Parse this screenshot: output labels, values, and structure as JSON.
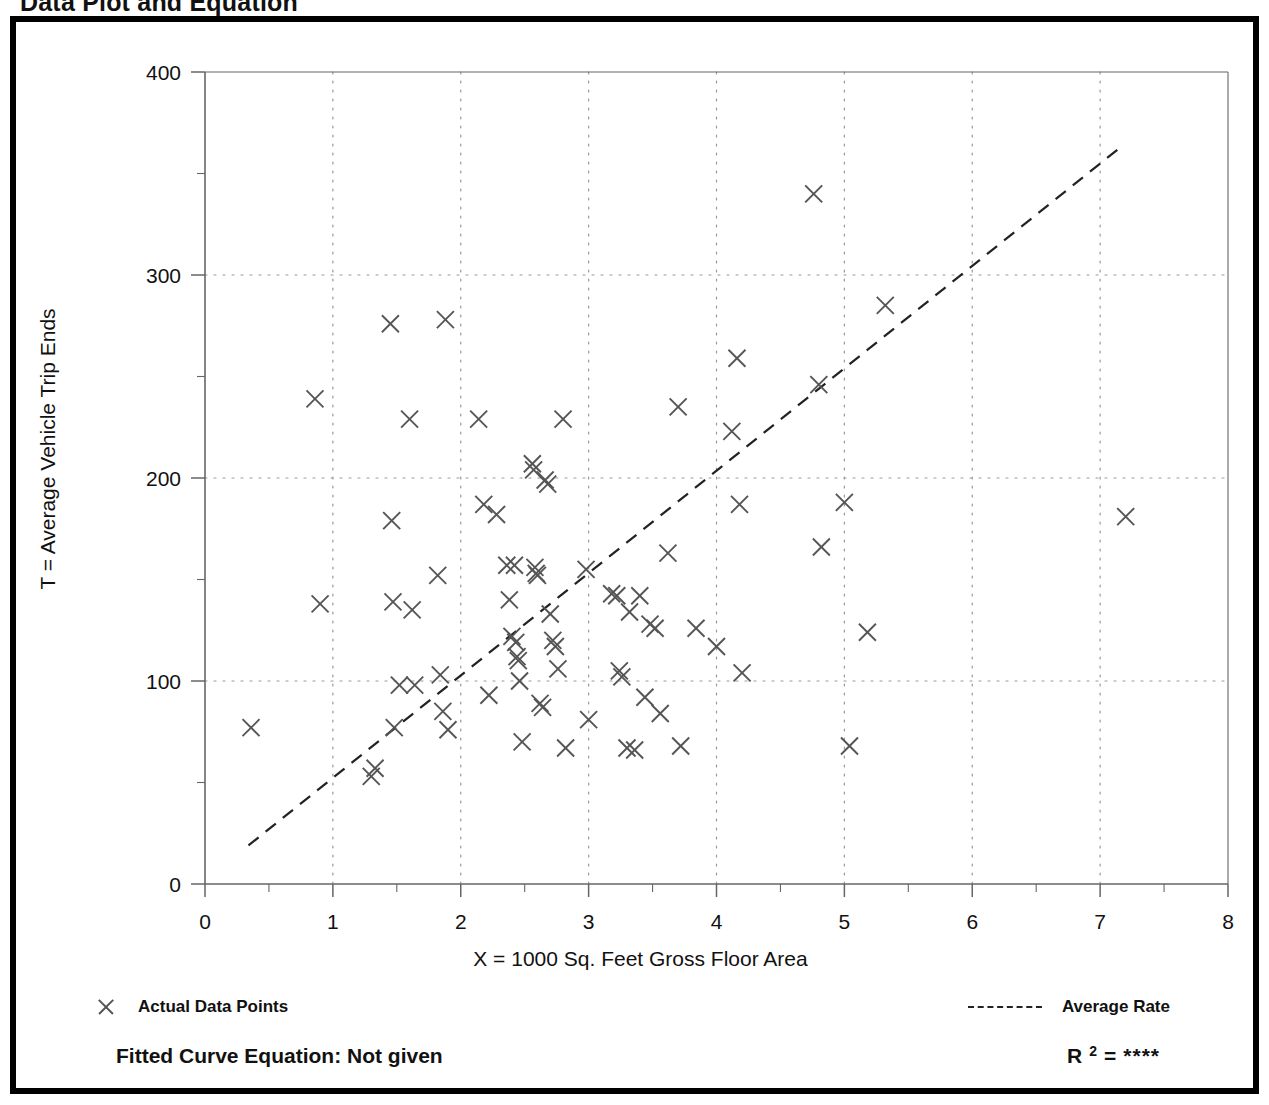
{
  "page": {
    "title": "Data Plot and Equation"
  },
  "legend": {
    "data_points_label": "Actual Data Points",
    "average_rate_label": "Average Rate",
    "marker_icon": "x-marker-icon",
    "line_icon": "dashed-line-icon"
  },
  "equation": {
    "fitted_curve_label": "Fitted Curve Equation:  Not given",
    "r_symbol": "R",
    "r_exponent": "2",
    "equals": "=",
    "r_squared_value": "****"
  },
  "colors": {
    "frame": "#000000",
    "marker": "#555555",
    "trendline": "#222222",
    "grid": "#999999",
    "axis": "#666666",
    "text": "#111111"
  },
  "chart_data": {
    "type": "scatter",
    "title": "Data Plot and Equation",
    "xlabel": "X = 1000 Sq. Feet Gross Floor Area",
    "ylabel": "T = Average Vehicle Trip Ends",
    "xlim": [
      0,
      8
    ],
    "ylim": [
      0,
      400
    ],
    "xticks": [
      0,
      1,
      2,
      3,
      4,
      5,
      6,
      7,
      8
    ],
    "xticklabels": [
      "0",
      "1",
      "2",
      "3",
      "4",
      "5",
      "6",
      "7",
      "8"
    ],
    "yticks": [
      0,
      100,
      200,
      300,
      400
    ],
    "yticklabels": [
      "0",
      "100",
      "200",
      "300",
      "400"
    ],
    "x_minor_tick_interval": 0.5,
    "y_minor_tick_interval": 50,
    "grid": true,
    "grid_style": "dotted",
    "grid_x_values": [
      1,
      2,
      3,
      4,
      5,
      6,
      7
    ],
    "grid_y_values": [
      100,
      200,
      300
    ],
    "legend_position": "below-axes",
    "series": [
      {
        "name": "Actual Data Points",
        "type": "scatter",
        "marker": "x",
        "points": [
          [
            0.36,
            77
          ],
          [
            0.86,
            239
          ],
          [
            0.9,
            138
          ],
          [
            1.3,
            53
          ],
          [
            1.33,
            57
          ],
          [
            1.45,
            276
          ],
          [
            1.46,
            179
          ],
          [
            1.47,
            139
          ],
          [
            1.48,
            77
          ],
          [
            1.52,
            98
          ],
          [
            1.6,
            229
          ],
          [
            1.62,
            135
          ],
          [
            1.64,
            98
          ],
          [
            1.82,
            152
          ],
          [
            1.84,
            103
          ],
          [
            1.86,
            85
          ],
          [
            1.88,
            278
          ],
          [
            1.9,
            76
          ],
          [
            2.14,
            229
          ],
          [
            2.18,
            187
          ],
          [
            2.22,
            93
          ],
          [
            2.28,
            182
          ],
          [
            2.36,
            157
          ],
          [
            2.38,
            140
          ],
          [
            2.4,
            122
          ],
          [
            2.42,
            157
          ],
          [
            2.43,
            119
          ],
          [
            2.44,
            112
          ],
          [
            2.45,
            110
          ],
          [
            2.46,
            100
          ],
          [
            2.48,
            70
          ],
          [
            2.56,
            207
          ],
          [
            2.57,
            204
          ],
          [
            2.58,
            156
          ],
          [
            2.59,
            153
          ],
          [
            2.6,
            152
          ],
          [
            2.62,
            89
          ],
          [
            2.64,
            87
          ],
          [
            2.66,
            199
          ],
          [
            2.68,
            197
          ],
          [
            2.7,
            133
          ],
          [
            2.72,
            120
          ],
          [
            2.74,
            117
          ],
          [
            2.76,
            106
          ],
          [
            2.8,
            229
          ],
          [
            2.82,
            67
          ],
          [
            2.98,
            155
          ],
          [
            3.0,
            81
          ],
          [
            3.18,
            143
          ],
          [
            3.22,
            142
          ],
          [
            3.24,
            105
          ],
          [
            3.26,
            102
          ],
          [
            3.3,
            67
          ],
          [
            3.32,
            134
          ],
          [
            3.36,
            66
          ],
          [
            3.4,
            142
          ],
          [
            3.44,
            92
          ],
          [
            3.48,
            128
          ],
          [
            3.52,
            126
          ],
          [
            3.56,
            84
          ],
          [
            3.62,
            163
          ],
          [
            3.7,
            235
          ],
          [
            3.72,
            68
          ],
          [
            3.84,
            126
          ],
          [
            4.0,
            117
          ],
          [
            4.12,
            223
          ],
          [
            4.16,
            259
          ],
          [
            4.18,
            187
          ],
          [
            4.2,
            104
          ],
          [
            4.76,
            340
          ],
          [
            4.8,
            246
          ],
          [
            4.82,
            166
          ],
          [
            5.0,
            188
          ],
          [
            5.04,
            68
          ],
          [
            5.18,
            124
          ],
          [
            5.32,
            285
          ],
          [
            7.2,
            181
          ]
        ]
      },
      {
        "name": "Average Rate",
        "type": "line",
        "style": "dashed",
        "x": [
          0.34,
          7.18
        ],
        "y": [
          19,
          364
        ],
        "slope": 50.4
      }
    ]
  }
}
